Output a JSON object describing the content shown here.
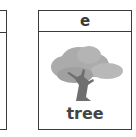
{
  "cards": [
    {
      "letter": "",
      "word": ""
    },
    {
      "letter": "e",
      "word": "tree",
      "icon": "tree-icon"
    }
  ],
  "colors": {
    "border": "#3a3a3a",
    "foliage": "#a9a9a9",
    "trunk": "#6f6f6f"
  }
}
